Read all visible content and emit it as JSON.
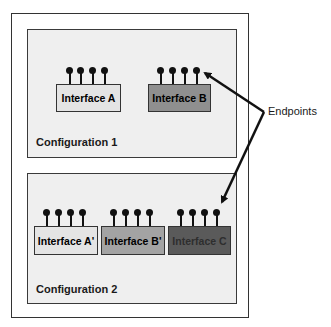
{
  "configurations": [
    {
      "label": "Configuration 1",
      "interfaces": [
        {
          "label": "Interface A",
          "fill": "#e4e4e4",
          "text_color": "#1a1a1a"
        },
        {
          "label": "Interface B",
          "fill": "#8f8f8f",
          "text_color": "#1a1a1a"
        }
      ]
    },
    {
      "label": "Configuration 2",
      "interfaces": [
        {
          "label": "Interface A'",
          "fill": "#e4e4e4",
          "text_color": "#1a1a1a"
        },
        {
          "label": "Interface B'",
          "fill": "#a3a3a3",
          "text_color": "#1a1a1a"
        },
        {
          "label": "Interface C",
          "fill": "#5a5a5a",
          "text_color": "#2e2e2e"
        }
      ]
    }
  ],
  "annotation": {
    "label": "Endpoints",
    "icon": "arrow-icon"
  },
  "endpoints_per_interface": 4
}
